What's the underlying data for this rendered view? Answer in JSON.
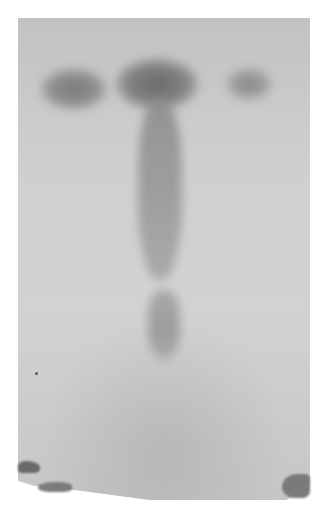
{
  "image": {
    "description": "Grayscale photograph of a paper chromatogram with three spots near the top and a long streak below the center spot",
    "colors": {
      "background": "#ffffff",
      "paper": "#cfcfcf",
      "spot_dark": "#6e6e6e",
      "spot_mid": "#8a8a8a"
    },
    "spots": [
      {
        "name": "left-spot",
        "x": 72,
        "y": 88
      },
      {
        "name": "center-spot",
        "x": 155,
        "y": 80
      },
      {
        "name": "right-spot",
        "x": 248,
        "y": 83
      }
    ]
  }
}
